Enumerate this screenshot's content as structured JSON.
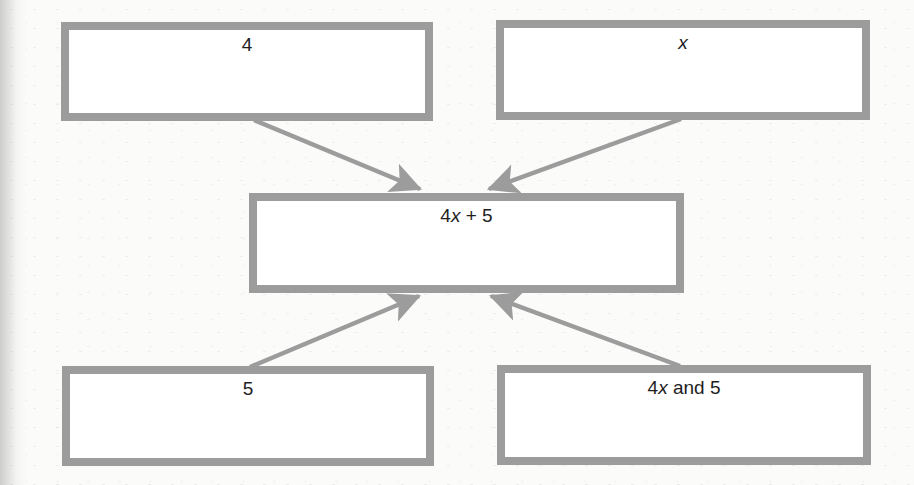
{
  "diagram": {
    "type": "flow-diagram",
    "boxes": {
      "top_left": {
        "label": "4"
      },
      "top_right": {
        "label": "x",
        "italic": true
      },
      "center": {
        "label_parts": [
          "4",
          "x",
          " + 5"
        ]
      },
      "bottom_left": {
        "label": "5"
      },
      "bottom_right": {
        "label_parts": [
          "4",
          "x",
          " and 5"
        ]
      }
    },
    "arrows": [
      {
        "from": "top_left",
        "to": "center"
      },
      {
        "from": "top_right",
        "to": "center"
      },
      {
        "from": "bottom_left",
        "to": "center"
      },
      {
        "from": "bottom_right",
        "to": "center"
      }
    ],
    "colors": {
      "box_border": "#9c9c9c",
      "arrow": "#9c9c9c",
      "text": "#1e1e1e",
      "background": "#fbfbfa"
    }
  }
}
